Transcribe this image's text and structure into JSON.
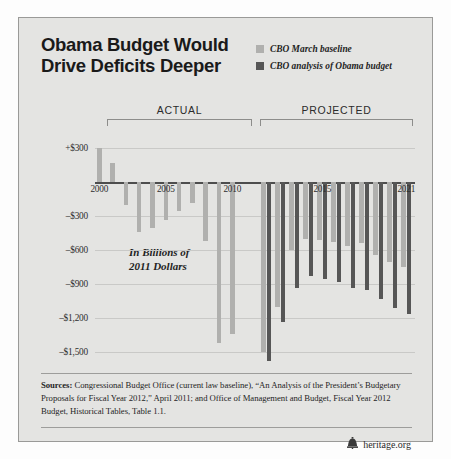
{
  "title": {
    "line1": "Obama Budget Would",
    "line2": "Drive Deficits Deeper"
  },
  "legend": {
    "items": [
      {
        "label": "CBO March baseline",
        "color": "#b0b0ae"
      },
      {
        "label": "CBO analysis of Obama budget",
        "color": "#565656"
      }
    ]
  },
  "bands": {
    "actual": "ACTUAL",
    "projected": "PROJECTED"
  },
  "annotation": {
    "line1": "In Billions of",
    "line2": "2011 Dollars"
  },
  "sources": {
    "label": "Sources:",
    "text": " Congressional Budget Office (current law baseline), “An Analysis of the President’s Budgetary Proposals for Fiscal Year 2012,” April 2011; and Office of Management and Budget, Fiscal Year 2012 Budget, Historical Tables, Table 1.1."
  },
  "brand": {
    "name": "heritage.org",
    "icon": "liberty-bell-icon"
  },
  "chart_data": {
    "type": "bar",
    "title": "Obama Budget Would Drive Deficits Deeper",
    "subtitle": "In Billions of 2011 Dollars",
    "xlabel": "",
    "ylabel": "",
    "ylim": [
      -1620,
      390
    ],
    "grid": true,
    "legend_position": "top-right",
    "ytick_values": [
      300,
      -300,
      -600,
      -900,
      -1200,
      -1500
    ],
    "ytick_labels": [
      "+$300",
      "–$300",
      "–$600",
      "–$900",
      "–$1,200",
      "–$1,500"
    ],
    "xtick_years": [
      2000,
      2005,
      2010,
      2015,
      2021
    ],
    "categories": [
      2000,
      2001,
      2002,
      2003,
      2004,
      2005,
      2006,
      2007,
      2008,
      2009,
      2010,
      2011,
      2012,
      2013,
      2014,
      2015,
      2016,
      2017,
      2018,
      2019,
      2020,
      2021
    ],
    "actual_years": [
      2000,
      2001,
      2002,
      2003,
      2004,
      2005,
      2006,
      2007,
      2008,
      2009,
      2010
    ],
    "projected_years": [
      2011,
      2012,
      2013,
      2014,
      2015,
      2016,
      2017,
      2018,
      2019,
      2020,
      2021
    ],
    "series": [
      {
        "name": "CBO March baseline",
        "color": "#b0b0ae",
        "values": [
          300,
          170,
          -205,
          -440,
          -400,
          -330,
          -255,
          -185,
          -515,
          -1415,
          -1335,
          -1500,
          -1100,
          -600,
          -500,
          -510,
          -530,
          -560,
          -540,
          -640,
          -700,
          -750
        ]
      },
      {
        "name": "CBO analysis of Obama budget",
        "color": "#565656",
        "values": [
          null,
          null,
          null,
          null,
          null,
          null,
          null,
          null,
          null,
          null,
          null,
          -1580,
          -1230,
          -930,
          -830,
          -855,
          -880,
          -930,
          -950,
          -1030,
          -1105,
          -1160
        ]
      }
    ]
  }
}
